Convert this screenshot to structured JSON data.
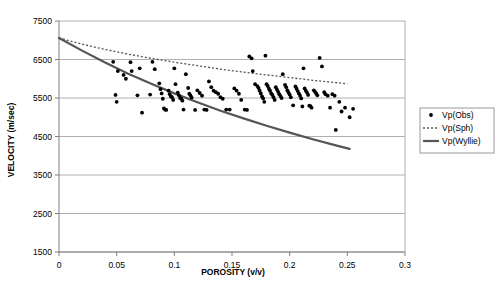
{
  "chart_data": {
    "type": "scatter",
    "title": "",
    "xlabel": "POROSITY (v/v)",
    "ylabel": "VELOCITY (m/sec)",
    "xlim": [
      0,
      0.3
    ],
    "ylim": [
      1500,
      7500
    ],
    "xticks": [
      0,
      0.05,
      0.1,
      0.15,
      0.2,
      0.25,
      0.3
    ],
    "xtick_labels": [
      "0",
      "0.05",
      "0.1",
      "0.15",
      "0.2",
      "0.25",
      "0.3"
    ],
    "yticks": [
      1500,
      2500,
      3500,
      4500,
      5500,
      6500,
      7500
    ],
    "ytick_labels": [
      "1500",
      "2500",
      "3500",
      "4500",
      "5500",
      "6500",
      "7500"
    ],
    "grid": "horizontal",
    "legend_position": "right",
    "colors": {
      "marker": "#000000",
      "sph_line": "#555555",
      "wyllie_line": "#555555",
      "grid": "#b0b0b0",
      "axis": "#808080",
      "background": "#ffffff"
    },
    "series": [
      {
        "name": "Vp(Obs)",
        "type": "scatter",
        "marker": "dot",
        "points": [
          [
            0.047,
            6440
          ],
          [
            0.049,
            5580
          ],
          [
            0.05,
            5400
          ],
          [
            0.051,
            6200
          ],
          [
            0.056,
            6100
          ],
          [
            0.058,
            6000
          ],
          [
            0.062,
            6430
          ],
          [
            0.063,
            6200
          ],
          [
            0.068,
            5570
          ],
          [
            0.07,
            6270
          ],
          [
            0.072,
            5120
          ],
          [
            0.079,
            5590
          ],
          [
            0.081,
            6440
          ],
          [
            0.083,
            6250
          ],
          [
            0.087,
            5880
          ],
          [
            0.088,
            5730
          ],
          [
            0.089,
            5620
          ],
          [
            0.09,
            5480
          ],
          [
            0.091,
            5230
          ],
          [
            0.092,
            5200
          ],
          [
            0.093,
            5190
          ],
          [
            0.095,
            5690
          ],
          [
            0.096,
            5600
          ],
          [
            0.097,
            5540
          ],
          [
            0.098,
            5520
          ],
          [
            0.099,
            5450
          ],
          [
            0.1,
            6270
          ],
          [
            0.101,
            5860
          ],
          [
            0.103,
            5640
          ],
          [
            0.104,
            5570
          ],
          [
            0.105,
            5500
          ],
          [
            0.106,
            5480
          ],
          [
            0.107,
            5430
          ],
          [
            0.108,
            5200
          ],
          [
            0.11,
            6120
          ],
          [
            0.112,
            5760
          ],
          [
            0.113,
            5610
          ],
          [
            0.114,
            5570
          ],
          [
            0.115,
            5510
          ],
          [
            0.118,
            5190
          ],
          [
            0.12,
            5700
          ],
          [
            0.122,
            5630
          ],
          [
            0.124,
            5560
          ],
          [
            0.126,
            5200
          ],
          [
            0.128,
            5190
          ],
          [
            0.13,
            5930
          ],
          [
            0.132,
            5780
          ],
          [
            0.134,
            5690
          ],
          [
            0.136,
            5650
          ],
          [
            0.138,
            5610
          ],
          [
            0.14,
            5520
          ],
          [
            0.142,
            5480
          ],
          [
            0.145,
            5200
          ],
          [
            0.148,
            5200
          ],
          [
            0.152,
            5750
          ],
          [
            0.154,
            5690
          ],
          [
            0.156,
            5610
          ],
          [
            0.158,
            5450
          ],
          [
            0.161,
            5200
          ],
          [
            0.163,
            5190
          ],
          [
            0.165,
            6580
          ],
          [
            0.167,
            6530
          ],
          [
            0.168,
            6200
          ],
          [
            0.17,
            5860
          ],
          [
            0.172,
            5810
          ],
          [
            0.173,
            5760
          ],
          [
            0.174,
            5690
          ],
          [
            0.175,
            5620
          ],
          [
            0.176,
            5540
          ],
          [
            0.177,
            5490
          ],
          [
            0.178,
            5400
          ],
          [
            0.179,
            6600
          ],
          [
            0.18,
            5860
          ],
          [
            0.181,
            5810
          ],
          [
            0.182,
            5740
          ],
          [
            0.183,
            5690
          ],
          [
            0.184,
            5620
          ],
          [
            0.185,
            5580
          ],
          [
            0.186,
            5520
          ],
          [
            0.187,
            5450
          ],
          [
            0.188,
            5780
          ],
          [
            0.189,
            5720
          ],
          [
            0.19,
            5660
          ],
          [
            0.191,
            5600
          ],
          [
            0.192,
            5550
          ],
          [
            0.193,
            5500
          ],
          [
            0.194,
            6120
          ],
          [
            0.196,
            5840
          ],
          [
            0.197,
            5780
          ],
          [
            0.198,
            5700
          ],
          [
            0.199,
            5640
          ],
          [
            0.2,
            5590
          ],
          [
            0.201,
            5520
          ],
          [
            0.203,
            5310
          ],
          [
            0.205,
            5800
          ],
          [
            0.206,
            5740
          ],
          [
            0.207,
            5680
          ],
          [
            0.208,
            5620
          ],
          [
            0.209,
            5560
          ],
          [
            0.21,
            5490
          ],
          [
            0.211,
            5280
          ],
          [
            0.213,
            5750
          ],
          [
            0.214,
            5690
          ],
          [
            0.215,
            5640
          ],
          [
            0.216,
            5580
          ],
          [
            0.217,
            5300
          ],
          [
            0.218,
            5290
          ],
          [
            0.219,
            5250
          ],
          [
            0.221,
            5700
          ],
          [
            0.222,
            5660
          ],
          [
            0.223,
            5620
          ],
          [
            0.224,
            5570
          ],
          [
            0.226,
            6540
          ],
          [
            0.228,
            6320
          ],
          [
            0.23,
            5650
          ],
          [
            0.231,
            5600
          ],
          [
            0.233,
            5560
          ],
          [
            0.235,
            5250
          ],
          [
            0.237,
            5600
          ],
          [
            0.239,
            5560
          ],
          [
            0.24,
            4670
          ],
          [
            0.243,
            5400
          ],
          [
            0.245,
            5150
          ],
          [
            0.248,
            5250
          ],
          [
            0.252,
            5000
          ],
          [
            0.255,
            5220
          ],
          [
            0.212,
            6270
          ]
        ]
      },
      {
        "name": "Vp(Sph)",
        "type": "line",
        "style": "dotted",
        "points": [
          [
            0.0,
            7060
          ],
          [
            0.02,
            6900
          ],
          [
            0.04,
            6760
          ],
          [
            0.06,
            6640
          ],
          [
            0.08,
            6530
          ],
          [
            0.1,
            6430
          ],
          [
            0.12,
            6340
          ],
          [
            0.14,
            6250
          ],
          [
            0.16,
            6170
          ],
          [
            0.18,
            6100
          ],
          [
            0.2,
            6030
          ],
          [
            0.22,
            5960
          ],
          [
            0.24,
            5900
          ],
          [
            0.25,
            5870
          ]
        ]
      },
      {
        "name": "Vp(Wyllie)",
        "type": "line",
        "style": "solid",
        "points": [
          [
            0.0,
            7060
          ],
          [
            0.02,
            6730
          ],
          [
            0.04,
            6420
          ],
          [
            0.06,
            6130
          ],
          [
            0.08,
            5870
          ],
          [
            0.1,
            5620
          ],
          [
            0.12,
            5390
          ],
          [
            0.14,
            5170
          ],
          [
            0.16,
            4970
          ],
          [
            0.18,
            4780
          ],
          [
            0.2,
            4600
          ],
          [
            0.22,
            4430
          ],
          [
            0.24,
            4270
          ],
          [
            0.252,
            4180
          ]
        ]
      }
    ],
    "legend": [
      {
        "label": "Vp(Obs)",
        "marker": "dot"
      },
      {
        "label": "Vp(Sph)",
        "marker": "dotted-line"
      },
      {
        "label": "Vp(Wyllie)",
        "marker": "solid-line"
      }
    ]
  }
}
